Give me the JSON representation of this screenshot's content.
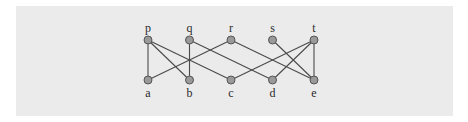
{
  "diagram": {
    "type": "bipartite-graph",
    "top_nodes": [
      {
        "id": "p",
        "label": "p",
        "x": 148,
        "y": 40
      },
      {
        "id": "q",
        "label": "q",
        "x": 189.5,
        "y": 40
      },
      {
        "id": "r",
        "label": "r",
        "x": 231,
        "y": 40
      },
      {
        "id": "s",
        "label": "s",
        "x": 272.5,
        "y": 40
      },
      {
        "id": "t",
        "label": "t",
        "x": 314,
        "y": 40
      }
    ],
    "bottom_nodes": [
      {
        "id": "a",
        "label": "a",
        "x": 148,
        "y": 80
      },
      {
        "id": "b",
        "label": "b",
        "x": 189.5,
        "y": 80
      },
      {
        "id": "c",
        "label": "c",
        "x": 231,
        "y": 80
      },
      {
        "id": "d",
        "label": "d",
        "x": 272.5,
        "y": 80
      },
      {
        "id": "e",
        "label": "e",
        "x": 314,
        "y": 80
      }
    ],
    "edges": [
      [
        "p",
        "a"
      ],
      [
        "p",
        "b"
      ],
      [
        "p",
        "c"
      ],
      [
        "q",
        "b"
      ],
      [
        "q",
        "d"
      ],
      [
        "r",
        "a"
      ],
      [
        "r",
        "e"
      ],
      [
        "s",
        "e"
      ],
      [
        "t",
        "c"
      ],
      [
        "t",
        "d"
      ],
      [
        "t",
        "e"
      ]
    ],
    "colors": {
      "background": "#ebebeb",
      "node_fill": "#9a9a9a",
      "node_stroke": "#555555",
      "edge": "#4a4a4a",
      "label": "#2a2a2a"
    }
  }
}
